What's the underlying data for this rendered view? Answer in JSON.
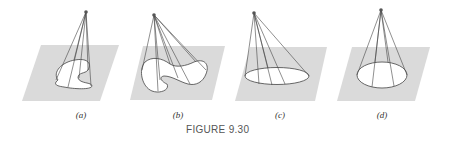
{
  "figure": {
    "caption": "FIGURE 9.30",
    "panels": [
      {
        "id": "a",
        "label": "(a)",
        "description": "cone over a spiral-like closed curve"
      },
      {
        "id": "b",
        "label": "(b)",
        "description": "cone over a kidney-shaped closed curve"
      },
      {
        "id": "c",
        "label": "(c)",
        "description": "oblique circular cone"
      },
      {
        "id": "d",
        "label": "(d)",
        "description": "right circular cone"
      }
    ]
  },
  "colors": {
    "plane": "#d9d9d9",
    "lines": "#444444",
    "apex": "#555555",
    "caption": "#555555"
  }
}
